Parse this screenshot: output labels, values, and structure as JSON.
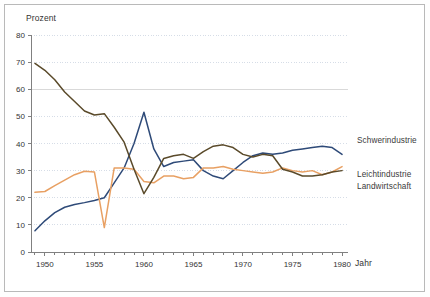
{
  "chart_data": {
    "type": "line",
    "title": "",
    "xlabel": "Jahr",
    "ylabel": "Prozent",
    "xlim": [
      1948.6,
      1980.6
    ],
    "ylim": [
      0,
      80
    ],
    "ytick_values": [
      0,
      10,
      20,
      30,
      40,
      50,
      60,
      70,
      80
    ],
    "ytick_labels": [
      "0",
      "10",
      "20",
      "30",
      "40",
      "50",
      "60",
      "70",
      "80"
    ],
    "xtick_values": [
      1950,
      1955,
      1960,
      1965,
      1970,
      1975,
      1980
    ],
    "xtick_labels": [
      "1950",
      "1955",
      "1960",
      "1965",
      "1970",
      "1975",
      "1980"
    ],
    "minor_xticks_every": 1,
    "grid": "horizontal-dotted",
    "legend_position": "right-outside",
    "x": [
      1949,
      1950,
      1951,
      1952,
      1953,
      1954,
      1955,
      1956,
      1957,
      1958,
      1959,
      1960,
      1961,
      1962,
      1963,
      1964,
      1965,
      1966,
      1967,
      1968,
      1969,
      1970,
      1971,
      1972,
      1973,
      1974,
      1975,
      1976,
      1977,
      1978,
      1979,
      1980
    ],
    "series": [
      {
        "name": "Schwerindustrie",
        "color": "#2e4a78",
        "values": [
          7.8,
          11.5,
          14.5,
          16.5,
          17.5,
          18.2,
          19.0,
          20.0,
          25.5,
          31.0,
          40.0,
          51.5,
          38.0,
          31.5,
          33.0,
          33.5,
          34.0,
          30.0,
          28.0,
          27.0,
          30.0,
          33.0,
          35.5,
          36.5,
          36.0,
          36.5,
          37.5,
          38.0,
          38.5,
          39.0,
          38.5,
          36.0
        ]
      },
      {
        "name": "Leichtindustrie",
        "color": "#e8a063",
        "values": [
          22.0,
          22.3,
          24.5,
          26.5,
          28.5,
          29.8,
          29.5,
          9.0,
          31.0,
          31.0,
          30.5,
          26.0,
          25.5,
          28.0,
          28.0,
          27.0,
          27.5,
          31.0,
          31.0,
          31.5,
          30.5,
          30.0,
          29.5,
          29.0,
          29.5,
          31.0,
          30.0,
          29.5,
          30.0,
          28.5,
          29.5,
          31.5
        ]
      },
      {
        "name": "Landwirtschaft",
        "color": "#5a4a2a",
        "values": [
          69.5,
          67.0,
          63.5,
          59.0,
          55.5,
          52.0,
          50.5,
          51.0,
          46.0,
          40.5,
          30.5,
          21.5,
          27.5,
          34.5,
          35.5,
          36.0,
          34.5,
          37.0,
          39.0,
          39.5,
          38.5,
          36.0,
          35.0,
          36.0,
          35.5,
          30.5,
          29.5,
          28.0,
          28.0,
          28.5,
          29.5,
          30.0
        ]
      }
    ]
  },
  "legend": {
    "items": [
      {
        "label": "Schwerindustrie"
      },
      {
        "label": "Leichtindustrie"
      },
      {
        "label": "Landwirtschaft"
      }
    ]
  },
  "axes": {
    "ylabel": "Prozent",
    "xlabel": "Jahr"
  }
}
